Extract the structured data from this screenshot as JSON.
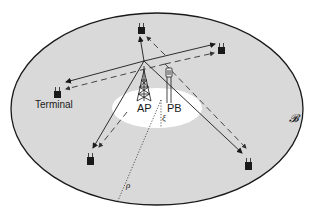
{
  "diagram": {
    "type": "wireless power / information network",
    "region_label": "B",
    "labels": {
      "terminal": "Terminal",
      "ap": "AP",
      "pb": "PB",
      "xi": "ξ",
      "rho": "ρ",
      "region": "𝓑"
    },
    "colors": {
      "background": "#ffffff",
      "region_fill": "#d9d9d9",
      "inner_disk_fill": "#ffffff",
      "stroke": "#1a1a1a",
      "terminal": "#1a1a1a"
    },
    "nodes": [
      {
        "id": "ap",
        "kind": "access-point-tower",
        "label": "AP"
      },
      {
        "id": "pb",
        "kind": "power-beacon",
        "label": "PB"
      },
      {
        "id": "t1",
        "kind": "terminal",
        "label": "Terminal"
      },
      {
        "id": "t2",
        "kind": "terminal"
      },
      {
        "id": "t3",
        "kind": "terminal"
      },
      {
        "id": "t4",
        "kind": "terminal"
      },
      {
        "id": "t5",
        "kind": "terminal"
      }
    ],
    "links": [
      {
        "from": "ap",
        "to": "t1",
        "style": "solid"
      },
      {
        "from": "pb",
        "to": "t1",
        "style": "dashed"
      },
      {
        "from": "ap",
        "to": "t2",
        "style": "solid"
      },
      {
        "from": "pb",
        "to": "t2",
        "style": "dashed"
      },
      {
        "from": "ap",
        "to": "t3",
        "style": "solid"
      },
      {
        "from": "pb",
        "to": "t3",
        "style": "dashed"
      },
      {
        "from": "ap",
        "to": "t4",
        "style": "solid"
      },
      {
        "from": "pb",
        "to": "t4",
        "style": "dashed"
      },
      {
        "from": "ap",
        "to": "t5",
        "style": "solid"
      },
      {
        "from": "pb",
        "to": "t5",
        "style": "dashed"
      }
    ]
  }
}
